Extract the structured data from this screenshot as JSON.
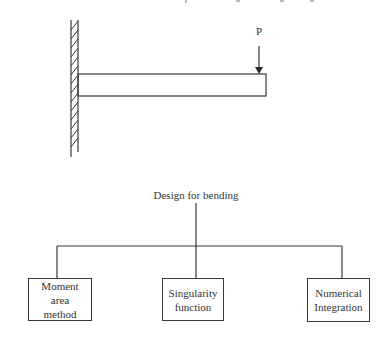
{
  "beam_figure": {
    "load_label": "P",
    "support": "fixed-wall",
    "load": "point-load-at-free-end"
  },
  "tree": {
    "root": "Design for bending",
    "children": [
      {
        "label": "Moment\narea\nmethod"
      },
      {
        "label": "Singularity\nfunction"
      },
      {
        "label": "Numerical\nIntegration"
      }
    ]
  },
  "colors": {
    "line": "#3a3a3a",
    "background": "#ffffff"
  }
}
